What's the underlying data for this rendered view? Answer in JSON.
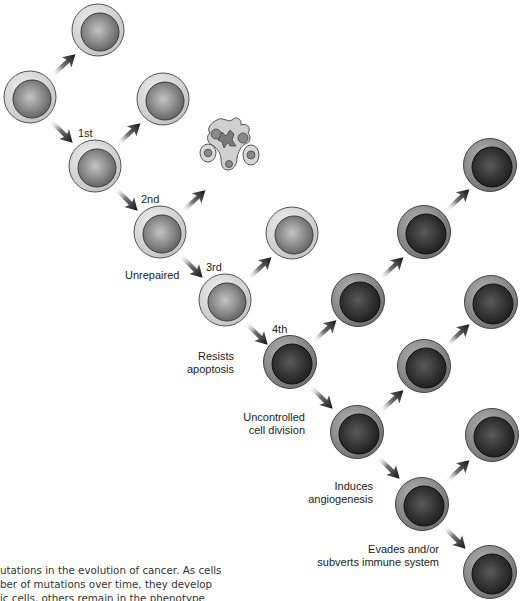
{
  "figure": {
    "labels": {
      "first": "1st",
      "second": "2nd",
      "third": "3rd",
      "fourth": "4th",
      "unrepaired": "Unrepaired",
      "resists_1": "Resists",
      "resists_2": "apoptosis",
      "uncontrolled_1": "Uncontrolled",
      "uncontrolled_2": "cell division",
      "induces_1": "Induces",
      "induces_2": "angiogenesis",
      "evades_1": "Evades and/or",
      "evades_2": "subverts immune system"
    },
    "cell_states": {
      "normal": {
        "cytoplasm": "#d6d6d6",
        "nucleus": "#8a8a8a"
      },
      "mutated": {
        "cytoplasm": "#9a9a9a",
        "nucleus": "#3a3a3a"
      }
    },
    "cells": [
      {
        "id": "origin",
        "x": 30,
        "y": 97,
        "state": "normal"
      },
      {
        "id": "origin-daughter",
        "x": 98,
        "y": 30,
        "state": "normal"
      },
      {
        "id": "mut1",
        "x": 95,
        "y": 166,
        "state": "normal"
      },
      {
        "id": "mut1-daughter",
        "x": 163,
        "y": 99,
        "state": "normal"
      },
      {
        "id": "mut2",
        "x": 160,
        "y": 232,
        "state": "normal"
      },
      {
        "id": "mut3",
        "x": 225,
        "y": 300,
        "state": "normal"
      },
      {
        "id": "mut3-daughter",
        "x": 292,
        "y": 233,
        "state": "normal"
      },
      {
        "id": "mut4",
        "x": 290,
        "y": 362,
        "state": "mutated"
      },
      {
        "id": "c5",
        "x": 358,
        "y": 300,
        "state": "mutated"
      },
      {
        "id": "c6",
        "x": 424,
        "y": 232,
        "state": "mutated"
      },
      {
        "id": "c7",
        "x": 490,
        "y": 165,
        "state": "mutated"
      },
      {
        "id": "c8",
        "x": 357,
        "y": 432,
        "state": "mutated"
      },
      {
        "id": "c9",
        "x": 424,
        "y": 366,
        "state": "mutated"
      },
      {
        "id": "c10",
        "x": 491,
        "y": 302,
        "state": "mutated"
      },
      {
        "id": "c11",
        "x": 422,
        "y": 504,
        "state": "mutated"
      },
      {
        "id": "c12",
        "x": 492,
        "y": 435,
        "state": "mutated"
      },
      {
        "id": "c13",
        "x": 490,
        "y": 572,
        "state": "mutated"
      }
    ],
    "apoptotic_cell": {
      "x": 230,
      "y": 150,
      "label": "apoptotic-cell"
    }
  },
  "caption": {
    "line1": "utations in the evolution of cancer. As cells",
    "line2": "ber of mutations over time, they develop",
    "line3": "ic cells, others remain in the phenotype"
  }
}
